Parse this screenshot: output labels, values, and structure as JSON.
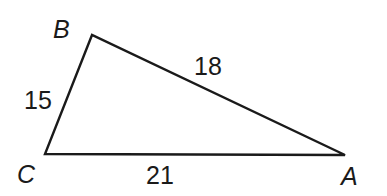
{
  "diagram": {
    "type": "triangle",
    "vertices": [
      {
        "name": "B",
        "x": 92,
        "y": 35,
        "label_x": 53,
        "label_y": 38
      },
      {
        "name": "C",
        "x": 45,
        "y": 154,
        "label_x": 17,
        "label_y": 183
      },
      {
        "name": "A",
        "x": 345,
        "y": 155,
        "label_x": 341,
        "label_y": 185
      }
    ],
    "sides": [
      {
        "name": "BC",
        "length": "15",
        "label_x": 24,
        "label_y": 109
      },
      {
        "name": "BA",
        "length": "18",
        "label_x": 194,
        "label_y": 75
      },
      {
        "name": "CA",
        "length": "21",
        "label_x": 146,
        "label_y": 184
      }
    ],
    "stroke_color": "#1a1a1a"
  }
}
